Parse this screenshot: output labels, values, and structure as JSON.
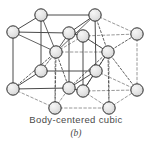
{
  "figure": {
    "title": "Body-centered cubic",
    "subtitle": "(b)",
    "structure_type": "body-centered-cubic",
    "projection": "isometric",
    "cell_count": 2,
    "colors": {
      "atom_fill": "#e2e2e2",
      "atom_fill_highlight": "#f4f4f4",
      "atom_stroke": "#2b2b2b",
      "edge_solid": "#4a4a4a",
      "edge_hidden": "#7d7d7d",
      "bond": "#3a3a3a",
      "caption": "#4a4a4a",
      "background": "#ffffff"
    },
    "atom_radius": 6.2,
    "atoms": [
      {
        "id": "a1",
        "name": "corner-atom-top-back-left",
        "x": 41,
        "y": 15,
        "role": "corner",
        "visible": true
      },
      {
        "id": "a2",
        "name": "corner-atom-top-back-mid",
        "x": 95,
        "y": 15,
        "role": "corner",
        "visible": true
      },
      {
        "id": "a3",
        "name": "corner-atom-top-front-left",
        "x": 13,
        "y": 32,
        "role": "corner",
        "visible": true
      },
      {
        "id": "a4",
        "name": "corner-atom-top-front-mid",
        "x": 69,
        "y": 33,
        "role": "corner",
        "visible": true
      },
      {
        "id": "a5",
        "name": "corner-atom-top-mid-right",
        "x": 83,
        "y": 36,
        "role": "corner",
        "visible": true
      },
      {
        "id": "a6",
        "name": "corner-atom-top-back-right",
        "x": 137,
        "y": 34,
        "role": "corner",
        "visible": true
      },
      {
        "id": "a7",
        "name": "body-center-atom-left-cell",
        "x": 56,
        "y": 52,
        "role": "body-center",
        "visible": true
      },
      {
        "id": "a8",
        "name": "body-center-atom-right-cell",
        "x": 108,
        "y": 52,
        "role": "body-center",
        "visible": true
      },
      {
        "id": "a9",
        "name": "corner-atom-mid-back-left",
        "x": 41,
        "y": 71,
        "role": "corner",
        "visible": true
      },
      {
        "id": "a10",
        "name": "corner-atom-mid-back-mid",
        "x": 96,
        "y": 71,
        "role": "corner",
        "visible": true
      },
      {
        "id": "a11",
        "name": "corner-atom-bottom-front-left",
        "x": 13,
        "y": 89,
        "role": "corner",
        "visible": true
      },
      {
        "id": "a12",
        "name": "corner-atom-bottom-front-mid",
        "x": 69,
        "y": 88,
        "role": "corner",
        "visible": true
      },
      {
        "id": "a13",
        "name": "corner-atom-bottom-mid-right",
        "x": 83,
        "y": 91,
        "role": "corner",
        "visible": true
      },
      {
        "id": "a14",
        "name": "corner-atom-bottom-back-right",
        "x": 137,
        "y": 90,
        "role": "corner",
        "visible": true
      },
      {
        "id": "a15",
        "name": "corner-atom-bottom-front-low",
        "x": 55,
        "y": 108,
        "role": "corner",
        "visible": true
      },
      {
        "id": "a16",
        "name": "corner-atom-bottom-mid-low",
        "x": 109,
        "y": 108,
        "role": "corner",
        "visible": true
      }
    ],
    "solid_edges": [
      {
        "name": "edge-top-back-left-to-mid",
        "x1": 41,
        "y1": 15,
        "x2": 95,
        "y2": 15
      },
      {
        "name": "edge-top-backleft-to-frontleft",
        "x1": 41,
        "y1": 15,
        "x2": 13,
        "y2": 32
      },
      {
        "name": "edge-top-backmid-to-frontmid",
        "x1": 95,
        "y1": 15,
        "x2": 69,
        "y2": 33
      },
      {
        "name": "edge-top-frontleft-to-frontmid",
        "x1": 13,
        "y1": 32,
        "x2": 69,
        "y2": 33
      },
      {
        "name": "edge-top-frontmid-to-midright",
        "x1": 69,
        "y1": 33,
        "x2": 83,
        "y2": 36
      },
      {
        "name": "edge-vert-left-front",
        "x1": 13,
        "y1": 32,
        "x2": 13,
        "y2": 89
      },
      {
        "name": "edge-vert-mid-front",
        "x1": 69,
        "y1": 33,
        "x2": 69,
        "y2": 88
      },
      {
        "name": "edge-vert-backleft",
        "x1": 41,
        "y1": 15,
        "x2": 41,
        "y2": 71
      },
      {
        "name": "edge-vert-midright-front",
        "x1": 83,
        "y1": 36,
        "x2": 83,
        "y2": 91
      },
      {
        "name": "edge-vert-backmid",
        "x1": 95,
        "y1": 15,
        "x2": 96,
        "y2": 71
      },
      {
        "name": "edge-bottom-backleft-to-frontleft",
        "x1": 41,
        "y1": 71,
        "x2": 13,
        "y2": 89
      },
      {
        "name": "edge-bottom-frontleft-to-frontmid",
        "x1": 13,
        "y1": 89,
        "x2": 69,
        "y2": 88
      },
      {
        "name": "edge-bottom-backleft-to-backmid",
        "x1": 41,
        "y1": 71,
        "x2": 96,
        "y2": 71
      },
      {
        "name": "edge-bottom-backmid-to-frontmid",
        "x1": 96,
        "y1": 71,
        "x2": 69,
        "y2": 88
      },
      {
        "name": "edge-bottom-frontmid-to-midright",
        "x1": 69,
        "y1": 88,
        "x2": 83,
        "y2": 91
      },
      {
        "name": "edge-bottom-backmid-to-midright",
        "x1": 96,
        "y1": 71,
        "x2": 83,
        "y2": 91
      }
    ],
    "hidden_edges": [
      {
        "name": "hidden-edge-top-midright-to-backright",
        "x1": 83,
        "y1": 36,
        "x2": 137,
        "y2": 34
      },
      {
        "name": "hidden-edge-top-backmid-to-backright",
        "x1": 95,
        "y1": 15,
        "x2": 137,
        "y2": 34
      },
      {
        "name": "hidden-edge-vert-backright",
        "x1": 137,
        "y1": 34,
        "x2": 137,
        "y2": 90
      },
      {
        "name": "hidden-edge-bottom-midright-to-backright",
        "x1": 83,
        "y1": 91,
        "x2": 137,
        "y2": 90
      },
      {
        "name": "hidden-edge-bottom-backmid-to-backright",
        "x1": 96,
        "y1": 71,
        "x2": 137,
        "y2": 90
      },
      {
        "name": "hidden-edge-vert-front-low-left",
        "x1": 55,
        "y1": 52,
        "x2": 55,
        "y2": 108
      },
      {
        "name": "hidden-edge-low-left-to-frontleft",
        "x1": 55,
        "y1": 108,
        "x2": 13,
        "y2": 89
      },
      {
        "name": "hidden-edge-low-left-to-lowmid",
        "x1": 55,
        "y1": 108,
        "x2": 109,
        "y2": 108
      },
      {
        "name": "hidden-edge-lowmid-to-midright",
        "x1": 109,
        "y1": 108,
        "x2": 83,
        "y2": 91
      },
      {
        "name": "hidden-edge-lowmid-to-backright",
        "x1": 109,
        "y1": 108,
        "x2": 137,
        "y2": 90
      },
      {
        "name": "hidden-edge-lowleft-to-frontmid",
        "x1": 55,
        "y1": 108,
        "x2": 69,
        "y2": 88
      },
      {
        "name": "hidden-edge-vert-lowmid",
        "x1": 109,
        "y1": 52,
        "x2": 109,
        "y2": 108
      },
      {
        "name": "hidden-edge-mid-horizontal-left",
        "x1": 56,
        "y1": 52,
        "x2": 108,
        "y2": 52
      },
      {
        "name": "hidden-edge-mid-left-to-frontmid",
        "x1": 56,
        "y1": 52,
        "x2": 83,
        "y2": 36
      },
      {
        "name": "hidden-edge-midright-to-center",
        "x1": 83,
        "y1": 36,
        "x2": 108,
        "y2": 52
      }
    ],
    "bonds": [
      {
        "name": "bond-center-left-to-a1",
        "x1": 56,
        "y1": 52,
        "x2": 41,
        "y2": 15,
        "style": "solid"
      },
      {
        "name": "bond-center-left-to-a3",
        "x1": 56,
        "y1": 52,
        "x2": 13,
        "y2": 32,
        "style": "solid"
      },
      {
        "name": "bond-center-left-to-a4",
        "x1": 56,
        "y1": 52,
        "x2": 69,
        "y2": 33,
        "style": "solid"
      },
      {
        "name": "bond-center-left-to-a2",
        "x1": 56,
        "y1": 52,
        "x2": 95,
        "y2": 15,
        "style": "solid"
      },
      {
        "name": "bond-center-left-to-a9",
        "x1": 56,
        "y1": 52,
        "x2": 41,
        "y2": 71,
        "style": "dashed"
      },
      {
        "name": "bond-center-left-to-a11",
        "x1": 56,
        "y1": 52,
        "x2": 13,
        "y2": 89,
        "style": "dashed"
      },
      {
        "name": "bond-center-left-to-a12",
        "x1": 56,
        "y1": 52,
        "x2": 69,
        "y2": 88,
        "style": "dashed"
      },
      {
        "name": "bond-center-left-to-a15",
        "x1": 56,
        "y1": 52,
        "x2": 55,
        "y2": 108,
        "style": "dashed"
      },
      {
        "name": "bond-center-right-to-a2",
        "x1": 108,
        "y1": 52,
        "x2": 95,
        "y2": 15,
        "style": "dashed"
      },
      {
        "name": "bond-center-right-to-a5",
        "x1": 108,
        "y1": 52,
        "x2": 83,
        "y2": 36,
        "style": "solid"
      },
      {
        "name": "bond-center-right-to-a6",
        "x1": 108,
        "y1": 52,
        "x2": 137,
        "y2": 34,
        "style": "dashed"
      },
      {
        "name": "bond-center-right-to-a10",
        "x1": 108,
        "y1": 52,
        "x2": 96,
        "y2": 71,
        "style": "solid"
      },
      {
        "name": "bond-center-right-to-a13",
        "x1": 108,
        "y1": 52,
        "x2": 83,
        "y2": 91,
        "style": "dashed"
      },
      {
        "name": "bond-center-right-to-a14",
        "x1": 108,
        "y1": 52,
        "x2": 137,
        "y2": 90,
        "style": "dashed"
      },
      {
        "name": "bond-center-right-to-a16",
        "x1": 108,
        "y1": 52,
        "x2": 109,
        "y2": 108,
        "style": "dashed"
      },
      {
        "name": "bond-center-right-to-a12",
        "x1": 108,
        "y1": 52,
        "x2": 69,
        "y2": 88,
        "style": "dashed"
      }
    ]
  }
}
